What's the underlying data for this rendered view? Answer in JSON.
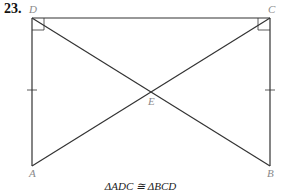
{
  "problem": {
    "number": "23."
  },
  "points": {
    "A": {
      "label": "A",
      "x": 32,
      "y": 166
    },
    "B": {
      "label": "B",
      "x": 270,
      "y": 166
    },
    "C": {
      "label": "C",
      "x": 270,
      "y": 18
    },
    "D": {
      "label": "D",
      "x": 32,
      "y": 18
    },
    "E": {
      "label": "E",
      "x": 151,
      "y": 92
    }
  },
  "caption": "ΔADC ≅ ΔBCD",
  "colors": {
    "line": "#333333",
    "label": "#8a8a8a"
  }
}
